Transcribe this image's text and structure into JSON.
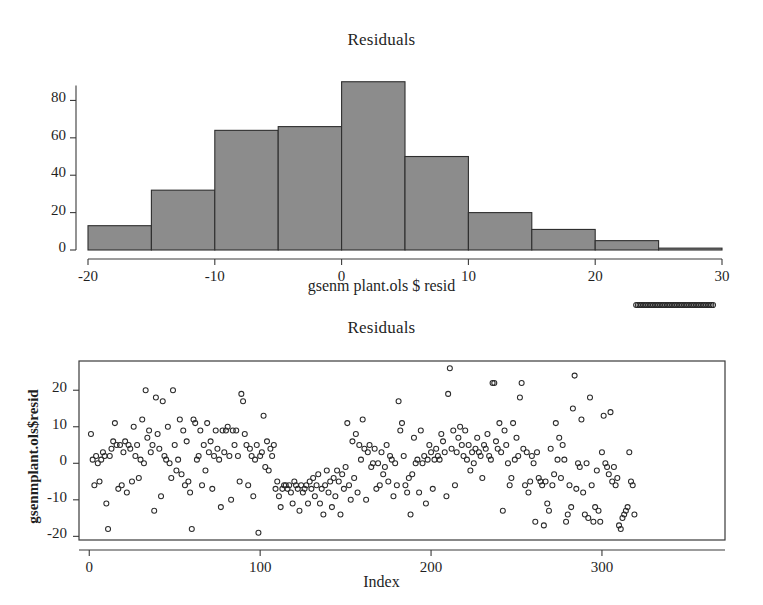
{
  "page": {
    "background": "#ffffff",
    "ink": "#1f1f1f"
  },
  "histogram_panel": {
    "title": "Residuals",
    "xlabel": "gsenm plant.ols $ resid",
    "x_tick_labels": [
      "-20",
      "-10",
      "0",
      "10",
      "20",
      "30"
    ],
    "y_tick_labels": [
      "0",
      "20",
      "40",
      "60",
      "80"
    ]
  },
  "scatter_panel": {
    "title": "Residuals",
    "xlabel": "Index",
    "ylabel": "gsenmplant.ols$resid",
    "x_tick_labels": [
      "0",
      "100",
      "200",
      "300"
    ],
    "y_tick_labels": [
      "-20",
      "-10",
      "0",
      "10",
      "20"
    ]
  },
  "chart_data": [
    {
      "type": "bar",
      "id": "residual-histogram",
      "title": "Residuals",
      "xlabel": "gsenm plant.ols $ resid",
      "ylabel": "",
      "bin_width": 5,
      "bin_edges": [
        -20,
        -15,
        -10,
        -5,
        0,
        5,
        10,
        15,
        20,
        25,
        30
      ],
      "categories": [
        "-20 to -15",
        "-15 to -10",
        "-10 to -5",
        "-5 to 0",
        "0 to 5",
        "5 to 10",
        "10 to 15",
        "15 to 20",
        "20 to 25",
        "25 to 30"
      ],
      "values": [
        13,
        32,
        64,
        66,
        90,
        50,
        20,
        11,
        5,
        1
      ],
      "xlim": [
        -20,
        30
      ],
      "ylim": [
        0,
        92
      ],
      "xticks": [
        -20,
        -10,
        0,
        10,
        20,
        30
      ],
      "yticks": [
        0,
        20,
        40,
        60,
        80
      ],
      "grid": false,
      "legend": "none",
      "bar_fill": "#8c8c8c",
      "bar_edge": "#2e2e2e"
    },
    {
      "type": "scatter",
      "id": "residual-index-plot",
      "title": "Residuals",
      "xlabel": "Index",
      "ylabel": "gsenmplant.ols$resid",
      "xlim": [
        -6,
        372
      ],
      "ylim": [
        -21,
        28
      ],
      "xticks": [
        0,
        100,
        200,
        300
      ],
      "yticks": [
        -20,
        -10,
        0,
        10,
        20
      ],
      "grid": false,
      "legend": "none",
      "marker": "open-circle",
      "marker_size": 5,
      "marker_color": "#2b2b2b",
      "n_points": 365,
      "x": [
        1,
        2,
        3,
        4,
        5,
        6,
        7,
        8,
        9,
        10,
        11,
        12,
        13,
        14,
        15,
        16,
        17,
        18,
        19,
        20,
        21,
        22,
        23,
        24,
        25,
        26,
        27,
        28,
        29,
        30,
        31,
        32,
        33,
        34,
        35,
        36,
        37,
        38,
        39,
        40,
        41,
        42,
        43,
        44,
        45,
        46,
        47,
        48,
        49,
        50,
        51,
        52,
        53,
        54,
        55,
        56,
        57,
        58,
        59,
        60,
        61,
        62,
        63,
        64,
        65,
        66,
        67,
        68,
        69,
        70,
        71,
        72,
        73,
        74,
        75,
        76,
        77,
        78,
        79,
        80,
        81,
        82,
        83,
        84,
        85,
        86,
        87,
        88,
        89,
        90,
        91,
        92,
        93,
        94,
        95,
        96,
        97,
        98,
        99,
        100,
        101,
        102,
        103,
        104,
        105,
        106,
        107,
        108,
        109,
        110,
        111,
        112,
        113,
        114,
        115,
        116,
        117,
        118,
        119,
        120,
        121,
        122,
        123,
        124,
        125,
        126,
        127,
        128,
        129,
        130,
        131,
        132,
        133,
        134,
        135,
        136,
        137,
        138,
        139,
        140,
        141,
        142,
        143,
        144,
        145,
        146,
        147,
        148,
        149,
        150,
        151,
        152,
        153,
        154,
        155,
        156,
        157,
        158,
        159,
        160,
        161,
        162,
        163,
        164,
        165,
        166,
        167,
        168,
        169,
        170,
        171,
        172,
        173,
        174,
        175,
        176,
        177,
        178,
        179,
        180,
        181,
        182,
        183,
        184,
        185,
        186,
        187,
        188,
        189,
        190,
        191,
        192,
        193,
        194,
        195,
        196,
        197,
        198,
        199,
        200,
        201,
        202,
        203,
        204,
        205,
        206,
        207,
        208,
        209,
        210,
        211,
        212,
        213,
        214,
        215,
        216,
        217,
        218,
        219,
        220,
        221,
        222,
        223,
        224,
        225,
        226,
        227,
        228,
        229,
        230,
        231,
        232,
        233,
        234,
        235,
        236,
        237,
        238,
        239,
        240,
        241,
        242,
        243,
        244,
        245,
        246,
        247,
        248,
        249,
        250,
        251,
        252,
        253,
        254,
        255,
        256,
        257,
        258,
        259,
        260,
        261,
        262,
        263,
        264,
        265,
        266,
        267,
        268,
        269,
        270,
        271,
        272,
        273,
        274,
        275,
        276,
        277,
        278,
        279,
        280,
        281,
        282,
        283,
        284,
        285,
        286,
        287,
        288,
        289,
        290,
        291,
        292,
        293,
        294,
        295,
        296,
        297,
        298,
        299,
        300,
        301,
        302,
        303,
        304,
        305,
        306,
        307,
        308,
        309,
        310,
        311,
        312,
        313,
        314,
        315,
        316,
        317,
        318,
        319,
        320,
        321,
        322,
        323,
        324,
        325,
        326,
        327,
        328,
        329,
        330,
        331,
        332,
        333,
        334,
        335,
        336,
        337,
        338,
        339,
        340,
        341,
        342,
        343,
        344,
        345,
        346,
        347,
        348,
        349,
        350,
        351,
        352,
        353,
        354,
        355,
        356,
        357,
        358,
        359,
        360,
        361,
        362,
        363,
        364,
        365
      ],
      "y": [
        8,
        1,
        -6,
        2,
        0,
        -5,
        1,
        3,
        2,
        -11,
        -18,
        2,
        4,
        6,
        11,
        5,
        -7,
        5,
        -6,
        3,
        6,
        -8,
        5,
        4,
        -5,
        10,
        2,
        5,
        -4,
        1,
        12,
        0,
        20,
        7,
        9,
        3,
        5,
        -13,
        18,
        8,
        4,
        -9,
        17,
        2,
        1,
        10,
        0,
        -4,
        20,
        5,
        -2,
        1,
        12,
        -3,
        9,
        -6,
        6,
        -5,
        -8,
        -18,
        12,
        11,
        1,
        2,
        9,
        -6,
        5,
        -2,
        11,
        3,
        6,
        -7,
        2,
        9,
        4,
        1,
        -12,
        9,
        3,
        9,
        10,
        2,
        -10,
        9,
        5,
        9,
        2,
        -5,
        19,
        17,
        8,
        5,
        -6,
        4,
        2,
        -9,
        1,
        5,
        -19,
        2,
        3,
        13,
        -1,
        6,
        -2,
        4,
        2,
        5,
        -7,
        -5,
        -9,
        -12,
        -7,
        -6,
        -6,
        -7,
        -6,
        -8,
        -11,
        -5,
        -6,
        -7,
        -13,
        -6,
        -8,
        -7,
        -6,
        -11,
        -5,
        -7,
        -4,
        -9,
        -6,
        -3,
        -11,
        -7,
        -14,
        -6,
        -2,
        -8,
        -5,
        -12,
        -4,
        -9,
        -2,
        -5,
        -14,
        -3,
        -7,
        -1,
        11,
        -6,
        -10,
        6,
        -4,
        8,
        -8,
        5,
        1,
        12,
        4,
        -10,
        3,
        5,
        -1,
        0,
        4,
        -7,
        0,
        -6,
        3,
        -3,
        -1,
        5,
        -5,
        2,
        1,
        -9,
        0,
        -6,
        17,
        9,
        11,
        2,
        -6,
        -8,
        -4,
        -14,
        -3,
        7,
        0,
        1,
        -8,
        9,
        0,
        2,
        -11,
        1,
        5,
        3,
        -7,
        1,
        4,
        2,
        1,
        8,
        6,
        3,
        -9,
        19,
        26,
        4,
        9,
        -6,
        3,
        7,
        10,
        5,
        2,
        9,
        1,
        5,
        -2,
        3,
        0,
        4,
        7,
        3,
        2,
        -4,
        5,
        4,
        8,
        2,
        1,
        22,
        22,
        6,
        4,
        11,
        3,
        -13,
        9,
        5,
        0,
        -6,
        -4,
        11,
        1,
        7,
        2,
        18,
        22,
        4,
        -6,
        3,
        -8,
        -5,
        2,
        0,
        -16,
        3,
        -4,
        -5,
        -6,
        -17,
        -5,
        -11,
        -13,
        4,
        -6,
        -3,
        11,
        1,
        7,
        -4,
        5,
        1,
        -16,
        -14,
        -6,
        -12,
        15,
        24,
        -7,
        0,
        -1,
        12,
        -8,
        -14,
        0,
        -15,
        18,
        -6,
        -16,
        -12,
        -2,
        -13,
        -16,
        3,
        13,
        0,
        -1,
        -3,
        14,
        -5,
        -1,
        -6,
        -4,
        -17,
        -18,
        -15,
        -14,
        -13,
        -12,
        3,
        -5,
        -6,
        -14
      ]
    }
  ]
}
